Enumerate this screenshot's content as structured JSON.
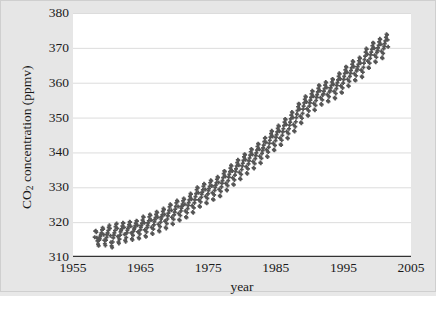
{
  "chart_data": {
    "type": "scatter",
    "title": "",
    "xlabel": "year",
    "ylabel_html": "CO2 concentration (ppmv)",
    "ylabel_main": "CO",
    "ylabel_sub": "2",
    "ylabel_rest": " concentration (ppmv)",
    "xlim": [
      1955,
      2005
    ],
    "ylim": [
      310,
      380
    ],
    "xticks": [
      1955,
      1965,
      1975,
      1985,
      1995,
      2005
    ],
    "yticks": [
      310,
      320,
      330,
      340,
      350,
      360,
      370,
      380
    ],
    "grid": "horizontal",
    "legend": "none",
    "marker": "cross",
    "marker_color": "#555555",
    "plot_bg": "#ffffff",
    "figure_bg": "#e6e6e6",
    "gridline_color": "#dcdcdc",
    "axis_color": "#333333",
    "series": [
      {
        "name": "Mauna Loa monthly mean CO2",
        "x": [
          1958.21,
          1958.29,
          1958.38,
          1958.46,
          1958.54,
          1958.62,
          1958.71,
          1958.79,
          1958.88,
          1958.96,
          1959.04,
          1959.12,
          1959.21,
          1959.29,
          1959.38,
          1959.46,
          1959.54,
          1959.62,
          1959.71,
          1959.79,
          1959.88,
          1959.96,
          1960.04,
          1960.12,
          1960.21,
          1960.29,
          1960.38,
          1960.46,
          1960.54,
          1960.62,
          1960.71,
          1960.79,
          1960.88,
          1960.96,
          1961.04,
          1961.12,
          1961.21,
          1961.29,
          1961.38,
          1961.46,
          1961.54,
          1961.62,
          1961.71,
          1961.79,
          1961.88,
          1961.96,
          1962.04,
          1962.12,
          1962.21,
          1962.29,
          1962.38,
          1962.46,
          1962.54,
          1962.62,
          1962.71,
          1962.79,
          1962.88,
          1962.96,
          1963.04,
          1963.12,
          1963.21,
          1963.29,
          1963.38,
          1963.46,
          1963.54,
          1963.62,
          1963.71,
          1963.79,
          1963.88,
          1963.96,
          1964.04,
          1964.12,
          1964.21,
          1964.29,
          1964.38,
          1964.46,
          1964.54,
          1964.62,
          1964.71,
          1964.79,
          1964.88,
          1964.96,
          1965.04,
          1965.12,
          1965.21,
          1965.29,
          1965.38,
          1965.46,
          1965.54,
          1965.62,
          1965.71,
          1965.79,
          1965.88,
          1965.96,
          1966.04,
          1966.12,
          1966.21,
          1966.29,
          1966.38,
          1966.46,
          1966.54,
          1966.62,
          1966.71,
          1966.79,
          1966.88,
          1966.96,
          1967.04,
          1967.12,
          1967.21,
          1967.29,
          1967.38,
          1967.46,
          1967.54,
          1967.62,
          1967.71,
          1967.79,
          1967.88,
          1967.96,
          1968.04,
          1968.12,
          1968.21,
          1968.29,
          1968.38,
          1968.46,
          1968.54,
          1968.62,
          1968.71,
          1968.79,
          1968.88,
          1968.96,
          1969.04,
          1969.12,
          1969.21,
          1969.29,
          1969.38,
          1969.46,
          1969.54,
          1969.62,
          1969.71,
          1969.79,
          1969.88,
          1969.96,
          1970.04,
          1970.12,
          1970.21,
          1970.29,
          1970.38,
          1970.46,
          1970.54,
          1970.62,
          1970.71,
          1970.79,
          1970.88,
          1970.96,
          1971.04,
          1971.12,
          1971.21,
          1971.29,
          1971.38,
          1971.46,
          1971.54,
          1971.62,
          1971.71,
          1971.79,
          1971.88,
          1971.96,
          1972.04,
          1972.12,
          1972.21,
          1972.29,
          1972.38,
          1972.46,
          1972.54,
          1972.62,
          1972.71,
          1972.79,
          1972.88,
          1972.96,
          1973.04,
          1973.12,
          1973.21,
          1973.29,
          1973.38,
          1973.46,
          1973.54,
          1973.62,
          1973.71,
          1973.79,
          1973.88,
          1973.96,
          1974.04,
          1974.12,
          1974.21,
          1974.29,
          1974.38,
          1974.46,
          1974.54,
          1974.62,
          1974.71,
          1974.79,
          1974.88,
          1974.96,
          1975.04,
          1975.12,
          1975.21,
          1975.29,
          1975.38,
          1975.46,
          1975.54,
          1975.62,
          1975.71,
          1975.79,
          1975.88,
          1975.96,
          1976.04,
          1976.12,
          1976.21,
          1976.29,
          1976.38,
          1976.46,
          1976.54,
          1976.62,
          1976.71,
          1976.79,
          1976.88,
          1976.96,
          1977.04,
          1977.12,
          1977.21,
          1977.29,
          1977.38,
          1977.46,
          1977.54,
          1977.62,
          1977.71,
          1977.79,
          1977.88,
          1977.96,
          1978.04,
          1978.12,
          1978.21,
          1978.29,
          1978.38,
          1978.46,
          1978.54,
          1978.62,
          1978.71,
          1978.79,
          1978.88,
          1978.96,
          1979.04,
          1979.12,
          1979.21,
          1979.29,
          1979.38,
          1979.46,
          1979.54,
          1979.62,
          1979.71,
          1979.79,
          1979.88,
          1979.96,
          1980.04,
          1980.12,
          1980.21,
          1980.29,
          1980.38,
          1980.46,
          1980.54,
          1980.62,
          1980.71,
          1980.79,
          1980.88,
          1980.96,
          1981.04,
          1981.12,
          1981.21,
          1981.29,
          1981.38,
          1981.46,
          1981.54,
          1981.62,
          1981.71,
          1981.79,
          1981.88,
          1981.96,
          1982.04,
          1982.12,
          1982.21,
          1982.29,
          1982.38,
          1982.46,
          1982.54,
          1982.62,
          1982.71,
          1982.79,
          1982.88,
          1982.96,
          1983.04,
          1983.12,
          1983.21,
          1983.29,
          1983.38,
          1983.46,
          1983.54,
          1983.62,
          1983.71,
          1983.79,
          1983.88,
          1983.96,
          1984.04,
          1984.12,
          1984.21,
          1984.29,
          1984.38,
          1984.46,
          1984.54,
          1984.62,
          1984.71,
          1984.79,
          1984.88,
          1984.96,
          1985.04,
          1985.12,
          1985.21,
          1985.29,
          1985.38,
          1985.46,
          1985.54,
          1985.62,
          1985.71,
          1985.79,
          1985.88,
          1985.96,
          1986.04,
          1986.12,
          1986.21,
          1986.29,
          1986.38,
          1986.46,
          1986.54,
          1986.62,
          1986.71,
          1986.79,
          1986.88,
          1986.96,
          1987.04,
          1987.12,
          1987.21,
          1987.29,
          1987.38,
          1987.46,
          1987.54,
          1987.62,
          1987.71,
          1987.79,
          1987.88,
          1987.96,
          1988.04,
          1988.12,
          1988.21,
          1988.29,
          1988.38,
          1988.46,
          1988.54,
          1988.62,
          1988.71,
          1988.79,
          1988.88,
          1988.96,
          1989.04,
          1989.12,
          1989.21,
          1989.29,
          1989.38,
          1989.46,
          1989.54,
          1989.62,
          1989.71,
          1989.79,
          1989.88,
          1989.96,
          1990.04,
          1990.12,
          1990.21,
          1990.29,
          1990.38,
          1990.46,
          1990.54,
          1990.62,
          1990.71,
          1990.79,
          1990.88,
          1990.96,
          1991.04,
          1991.12,
          1991.21,
          1991.29,
          1991.38,
          1991.46,
          1991.54,
          1991.62,
          1991.71,
          1991.79,
          1991.88,
          1991.96,
          1992.04,
          1992.12,
          1992.21,
          1992.29,
          1992.38,
          1992.46,
          1992.54,
          1992.62,
          1992.71,
          1992.79,
          1992.88,
          1992.96,
          1993.04,
          1993.12,
          1993.21,
          1993.29,
          1993.38,
          1993.46,
          1993.54,
          1993.62,
          1993.71,
          1993.79,
          1993.88,
          1993.96,
          1994.04,
          1994.12,
          1994.21,
          1994.29,
          1994.38,
          1994.46,
          1994.54,
          1994.62,
          1994.71,
          1994.79,
          1994.88,
          1994.96,
          1995.04,
          1995.12,
          1995.21,
          1995.29,
          1995.38,
          1995.46,
          1995.54,
          1995.62,
          1995.71,
          1995.79,
          1995.88,
          1995.96,
          1996.04,
          1996.12,
          1996.21,
          1996.29,
          1996.38,
          1996.46,
          1996.54,
          1996.62,
          1996.71,
          1996.79,
          1996.88,
          1996.96,
          1997.04,
          1997.12,
          1997.21,
          1997.29,
          1997.38,
          1997.46,
          1997.54,
          1997.62,
          1997.71,
          1997.79,
          1997.88,
          1997.96,
          1998.04,
          1998.12,
          1998.21,
          1998.29,
          1998.38,
          1998.46,
          1998.54,
          1998.62,
          1998.71,
          1998.79,
          1998.88,
          1998.96,
          1999.04,
          1999.12,
          1999.21,
          1999.29,
          1999.38,
          1999.46,
          1999.54,
          1999.62,
          1999.71,
          1999.79,
          1999.88,
          1999.96,
          2000.04,
          2000.12,
          2000.21,
          2000.29,
          2000.38,
          2000.46,
          2000.54,
          2000.62,
          2000.71,
          2000.79,
          2000.88,
          2000.96,
          2001.04,
          2001.12,
          2001.21,
          2001.29,
          2001.38,
          2001.46,
          2001.54,
          2001.62
        ],
        "y": [
          315.7,
          317.4,
          317.5,
          317.1,
          315.5,
          314.6,
          313.7,
          313.2,
          314.8,
          315.3,
          315.9,
          316.4,
          316.9,
          317.8,
          318.4,
          318.0,
          316.4,
          314.8,
          313.8,
          313.3,
          314.8,
          315.6,
          316.4,
          316.9,
          317.6,
          318.5,
          319.1,
          318.2,
          316.1,
          314.2,
          313.2,
          312.7,
          314.3,
          315.5,
          316.3,
          316.9,
          317.6,
          318.7,
          319.4,
          319.6,
          318.2,
          315.9,
          314.3,
          313.9,
          315.1,
          316.3,
          317.2,
          317.7,
          318.1,
          318.9,
          319.8,
          319.7,
          318.5,
          316.5,
          314.8,
          314.4,
          315.6,
          316.9,
          317.6,
          318.1,
          318.6,
          319.3,
          320.1,
          320.0,
          318.8,
          316.9,
          315.2,
          314.9,
          316.2,
          317.4,
          318.0,
          318.4,
          319.0,
          319.7,
          320.4,
          320.3,
          319.1,
          317.2,
          315.6,
          315.3,
          316.6,
          317.8,
          318.5,
          319.1,
          319.7,
          320.6,
          321.6,
          321.4,
          319.8,
          317.8,
          316.1,
          315.8,
          317.2,
          318.4,
          319.1,
          319.8,
          320.4,
          321.5,
          322.2,
          321.9,
          320.6,
          318.5,
          316.8,
          316.6,
          318.0,
          319.2,
          320.1,
          320.7,
          321.3,
          322.2,
          323.0,
          322.7,
          321.4,
          319.4,
          317.6,
          317.3,
          318.7,
          320.0,
          320.9,
          321.5,
          322.1,
          323.1,
          323.9,
          323.6,
          322.2,
          320.3,
          318.5,
          318.2,
          319.6,
          320.9,
          321.8,
          322.6,
          323.4,
          324.4,
          325.1,
          324.9,
          323.4,
          321.4,
          319.6,
          319.4,
          320.8,
          322.1,
          322.9,
          323.7,
          324.5,
          325.5,
          326.2,
          325.9,
          324.5,
          322.5,
          320.7,
          320.5,
          321.9,
          323.2,
          324.0,
          324.6,
          325.2,
          326.1,
          326.8,
          326.5,
          325.1,
          323.2,
          321.5,
          321.3,
          322.7,
          323.9,
          324.8,
          325.6,
          326.4,
          327.4,
          328.2,
          328.0,
          326.6,
          324.7,
          322.9,
          322.7,
          324.1,
          325.5,
          326.4,
          327.3,
          328.2,
          329.3,
          330.0,
          329.8,
          328.4,
          326.4,
          324.6,
          324.4,
          325.8,
          327.1,
          328.0,
          328.6,
          329.3,
          330.3,
          331.0,
          330.8,
          329.4,
          327.4,
          325.6,
          325.4,
          326.8,
          328.1,
          329.0,
          329.6,
          330.3,
          331.3,
          332.0,
          331.8,
          330.4,
          328.4,
          326.6,
          326.4,
          327.8,
          329.1,
          330.0,
          330.6,
          331.3,
          332.3,
          333.0,
          332.8,
          331.4,
          329.4,
          327.6,
          327.4,
          328.8,
          330.1,
          331.1,
          331.9,
          332.8,
          333.9,
          334.7,
          334.5,
          333.1,
          331.1,
          329.3,
          329.1,
          330.5,
          331.9,
          332.9,
          333.7,
          334.5,
          335.5,
          336.3,
          336.1,
          334.7,
          332.7,
          330.9,
          330.7,
          332.1,
          333.5,
          334.5,
          335.3,
          336.1,
          337.1,
          337.9,
          337.7,
          336.3,
          334.3,
          332.5,
          332.3,
          333.7,
          335.1,
          336.1,
          336.9,
          337.7,
          338.7,
          339.5,
          339.3,
          337.9,
          335.9,
          334.1,
          333.9,
          335.3,
          336.7,
          337.6,
          338.4,
          339.2,
          340.2,
          341.0,
          340.8,
          339.4,
          337.4,
          335.6,
          335.4,
          336.8,
          338.2,
          339.1,
          339.9,
          340.7,
          341.7,
          342.5,
          342.3,
          340.9,
          338.9,
          337.1,
          336.9,
          338.3,
          339.7,
          340.5,
          341.3,
          342.1,
          343.1,
          344.1,
          344.2,
          342.9,
          340.8,
          338.9,
          338.7,
          340.1,
          341.5,
          342.6,
          343.5,
          344.4,
          345.4,
          346.2,
          346.0,
          344.6,
          342.6,
          340.8,
          340.6,
          342.0,
          343.4,
          344.3,
          345.1,
          345.9,
          346.9,
          347.7,
          347.5,
          346.1,
          344.1,
          342.3,
          342.1,
          343.5,
          344.9,
          345.9,
          346.8,
          347.7,
          348.7,
          349.6,
          349.4,
          348.0,
          346.0,
          344.2,
          344.0,
          345.4,
          346.8,
          347.8,
          348.7,
          349.6,
          350.7,
          351.6,
          351.4,
          350.0,
          348.0,
          346.2,
          346.0,
          347.4,
          348.8,
          350.0,
          351.0,
          352.0,
          353.1,
          354.0,
          353.8,
          352.4,
          350.4,
          348.6,
          348.4,
          349.8,
          351.2,
          352.4,
          353.3,
          354.2,
          355.2,
          356.1,
          355.9,
          354.5,
          352.5,
          350.7,
          350.5,
          351.9,
          353.3,
          354.2,
          355.0,
          355.8,
          356.8,
          357.7,
          357.5,
          356.1,
          354.1,
          352.3,
          352.1,
          353.5,
          354.9,
          355.8,
          356.6,
          357.4,
          358.4,
          359.3,
          359.1,
          357.7,
          355.7,
          353.9,
          353.7,
          355.1,
          356.5,
          356.9,
          357.6,
          358.3,
          359.3,
          360.2,
          360.0,
          358.6,
          356.6,
          354.8,
          354.6,
          356.0,
          357.4,
          357.8,
          358.5,
          359.2,
          360.2,
          361.1,
          360.9,
          359.5,
          357.5,
          355.7,
          355.5,
          356.9,
          358.3,
          359.2,
          360.0,
          360.8,
          361.8,
          362.7,
          362.5,
          361.1,
          359.1,
          357.3,
          357.1,
          358.5,
          359.9,
          360.9,
          361.8,
          362.7,
          363.7,
          364.6,
          364.4,
          363.0,
          361.0,
          359.2,
          359.0,
          360.4,
          361.8,
          362.7,
          363.5,
          364.3,
          365.3,
          366.2,
          366.0,
          364.6,
          362.6,
          360.8,
          360.6,
          362.0,
          363.4,
          363.9,
          364.6,
          365.3,
          366.3,
          367.2,
          367.0,
          365.6,
          363.6,
          361.8,
          361.6,
          363.0,
          364.4,
          365.6,
          366.6,
          367.6,
          368.8,
          369.8,
          369.6,
          368.2,
          366.2,
          364.4,
          364.2,
          365.6,
          367.0,
          368.0,
          368.8,
          369.6,
          370.6,
          371.5,
          371.3,
          369.9,
          367.9,
          366.1,
          365.9,
          367.3,
          368.7,
          369.3,
          370.0,
          370.7,
          371.7,
          372.6,
          372.4,
          371.0,
          369.0,
          367.2,
          367.0,
          368.4,
          369.8,
          370.4,
          371.2,
          372.0,
          373.0,
          373.9,
          373.7,
          372.3,
          370.3
        ]
      }
    ]
  }
}
